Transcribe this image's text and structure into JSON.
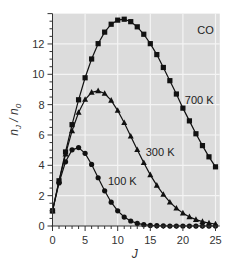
{
  "chart_data": {
    "type": "line",
    "title": "",
    "molecule_label": "CO",
    "xlabel": "J",
    "ylabel": "n_J / n_0",
    "xlim": [
      0,
      25.5
    ],
    "ylim": [
      0,
      14
    ],
    "xticks": [
      0,
      5,
      10,
      15,
      20,
      25
    ],
    "yticks": [
      0,
      2,
      4,
      6,
      8,
      10,
      12
    ],
    "grid": true,
    "legend": "inline labels",
    "x": [
      0,
      1,
      2,
      3,
      4,
      5,
      6,
      7,
      8,
      9,
      10,
      11,
      12,
      13,
      14,
      15,
      16,
      17,
      18,
      19,
      20,
      21,
      22,
      23,
      24,
      25
    ],
    "series": [
      {
        "name": "700 K",
        "marker": "square",
        "label_pos": {
          "J": 20.3,
          "v": 8.3
        },
        "values": [
          1.0,
          2.98,
          4.88,
          6.68,
          8.32,
          9.77,
          11.01,
          12.02,
          12.78,
          13.3,
          13.57,
          13.63,
          13.47,
          13.13,
          12.64,
          12.02,
          11.3,
          10.45,
          9.58,
          8.7,
          7.77,
          6.93,
          6.08,
          5.3,
          4.56,
          3.9
        ]
      },
      {
        "name": "300 K",
        "marker": "triangle",
        "label_pos": {
          "J": 14.3,
          "v": 4.9
        },
        "values": [
          1.0,
          2.95,
          4.73,
          6.27,
          7.48,
          8.34,
          8.81,
          8.91,
          8.73,
          8.28,
          7.61,
          6.81,
          5.92,
          5.03,
          4.17,
          3.37,
          2.68,
          2.08,
          1.57,
          1.17,
          0.85,
          0.6,
          0.42,
          0.29,
          0.19,
          0.13
        ]
      },
      {
        "name": "100 K",
        "marker": "circle",
        "label_pos": {
          "J": 8.5,
          "v": 2.95
        },
        "values": [
          1.0,
          2.84,
          4.23,
          5.02,
          5.17,
          4.79,
          4.06,
          3.18,
          2.32,
          1.57,
          1.0,
          0.59,
          0.33,
          0.17,
          0.09,
          0.04,
          0.02,
          0.01,
          0.0,
          0.0,
          0.0,
          0.0,
          0.0,
          0.0,
          0.0,
          0.0
        ]
      }
    ]
  },
  "colors": {
    "panel_bg": "#dcdcdc",
    "grid": "#f4f4f4",
    "series": "#111111",
    "axis": "#333333"
  }
}
